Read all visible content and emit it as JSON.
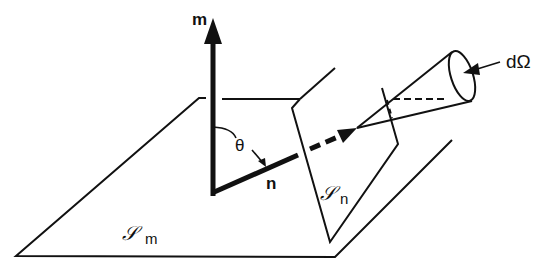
{
  "diagram": {
    "type": "geometry-illustration",
    "labels": {
      "vector_m": "m",
      "vector_n": "n",
      "angle": "θ",
      "solid_angle": "dΩ",
      "surface_m_symbol": "𝒮",
      "surface_m_sub": "m",
      "surface_n_symbol": "𝒮",
      "surface_n_sub": "n"
    },
    "colors": {
      "ink": "#111111",
      "background": "#ffffff"
    }
  }
}
